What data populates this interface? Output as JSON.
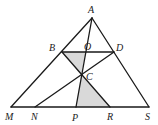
{
  "diagram": {
    "type": "geometry-figure",
    "points": [
      "A",
      "B",
      "O",
      "D",
      "C",
      "M",
      "N",
      "P",
      "R",
      "S"
    ],
    "segments": [
      [
        "A",
        "M"
      ],
      [
        "A",
        "S"
      ],
      [
        "M",
        "S"
      ],
      [
        "B",
        "D"
      ],
      [
        "A",
        "P"
      ],
      [
        "B",
        "R"
      ],
      [
        "N",
        "D"
      ]
    ],
    "shaded_regions": [
      [
        "B",
        "O",
        "C"
      ],
      [
        "C",
        "P",
        "R"
      ]
    ],
    "colors": {
      "line": "#1a1a1a",
      "shade": "#d9d9d9",
      "label": "#222222"
    }
  },
  "labels": {
    "A": "A",
    "B": "B",
    "O": "O",
    "D": "D",
    "C": "C",
    "M": "M",
    "N": "N",
    "P": "P",
    "R": "R",
    "S": "S"
  }
}
